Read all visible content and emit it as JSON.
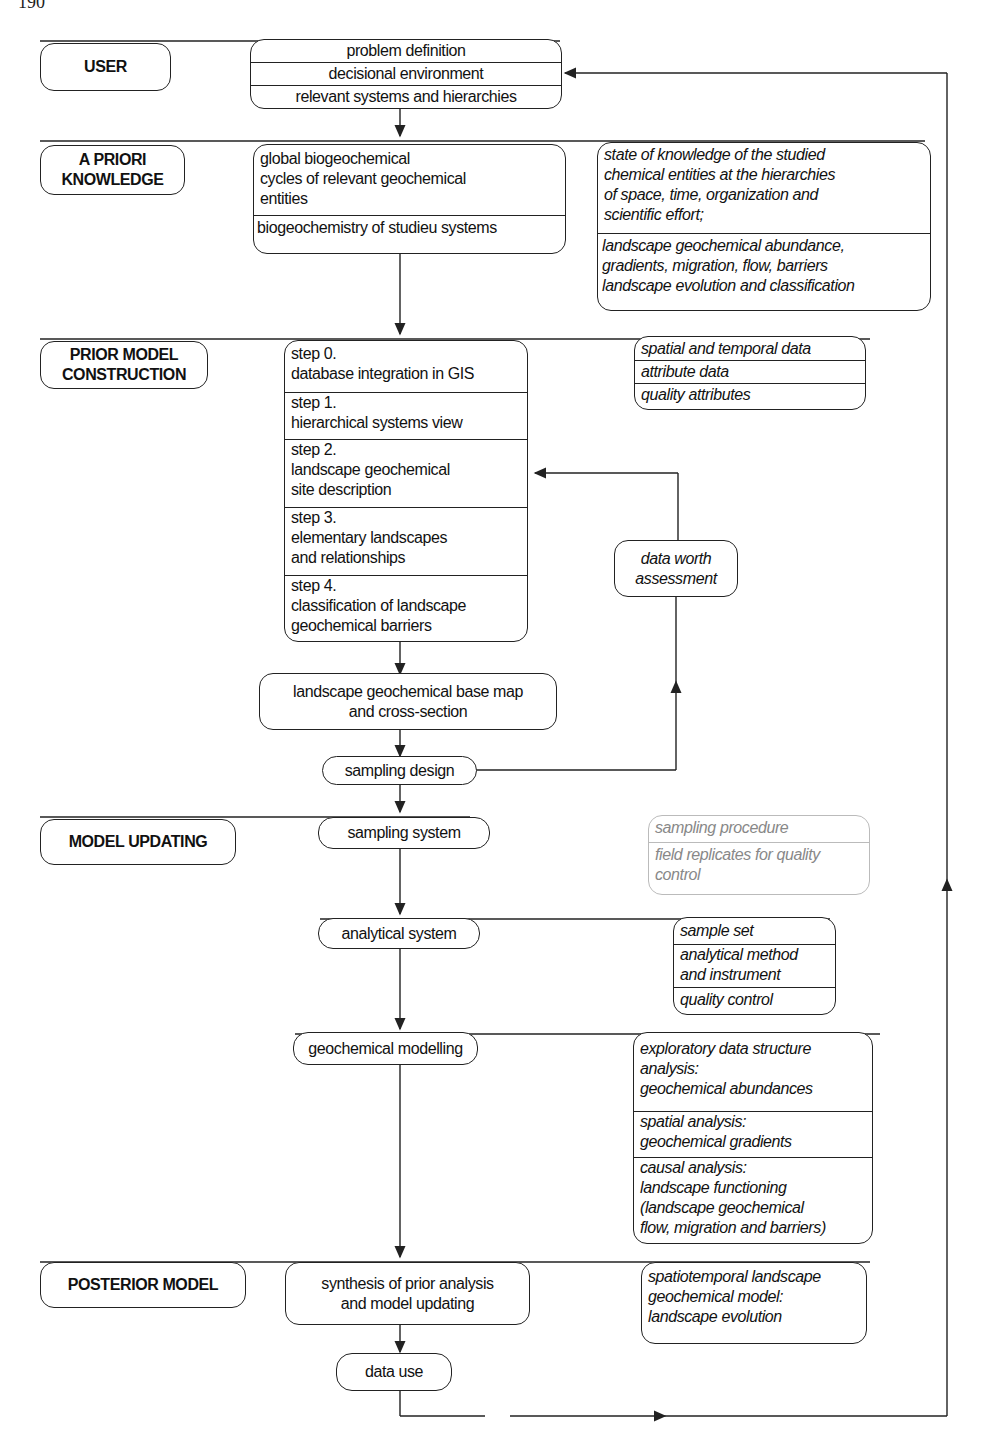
{
  "page": {
    "number": "190"
  },
  "colors": {
    "ink": "#222222",
    "faint": "#bbbbbb",
    "background": "#ffffff"
  },
  "stages": {
    "user": "USER",
    "apriori": "A PRIORI\nKNOWLEDGE",
    "prior_model": "PRIOR MODEL\nCONSTRUCTION",
    "model_updating": "MODEL UPDATING",
    "posterior": "POSTERIOR MODEL"
  },
  "user_box": {
    "items": [
      "problem definition",
      "decisional environment",
      "relevant systems and hierarchies"
    ]
  },
  "apriori_box": {
    "items": [
      "global biogeochemical\ncycles of relevant geochemical\nentities",
      "biogeochemistry of studieu systems"
    ]
  },
  "apriori_side": {
    "items": [
      "state of knowledge of the studied\nchemical entities at the hierarchies\nof space, time, organization and\nscientific effort;",
      "landscape geochemical abundance,\ngradients, migration, flow, barriers\nlandscape evolution and classification"
    ]
  },
  "steps_box": {
    "items": [
      "step 0.\ndatabase integration in GIS",
      "step 1.\nhierarchical systems view",
      "step 2.\nlandscape geochemical\nsite description",
      "step 3.\nelementary landscapes\nand relationships",
      "step 4.\nclassification of landscape\ngeochemical barriers"
    ]
  },
  "prior_side": {
    "items": [
      "spatial and temporal data",
      "attribute data",
      "quality attributes"
    ]
  },
  "data_worth": "data worth\nassessment",
  "base_map": "landscape geochemical base map\nand cross-section",
  "sampling_design": "sampling design",
  "sampling_system": "sampling system",
  "sampling_side": {
    "items": [
      "sampling procedure",
      "field replicates for quality\ncontrol"
    ]
  },
  "analytical_system": "analytical system",
  "analytical_side": {
    "items": [
      "sample set",
      "analytical method\nand instrument",
      "quality control"
    ]
  },
  "geochem_modelling": "geochemical modelling",
  "modelling_side": {
    "items": [
      "exploratory data structure\nanalysis:\ngeochemical abundances",
      "spatial analysis:\ngeochemical gradients",
      "causal analysis:\nlandscape functioning\n(landscape geochemical\nflow, migration and barriers)"
    ]
  },
  "synthesis": "synthesis of prior analysis\nand model updating",
  "posterior_side": "spatiotemporal landscape\ngeochemical model:\nlandscape evolution",
  "data_use": "data use"
}
